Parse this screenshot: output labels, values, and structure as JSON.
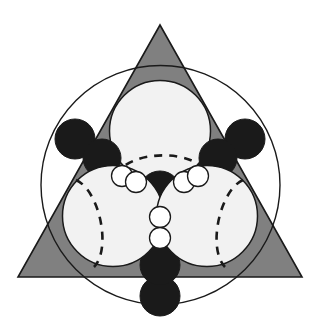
{
  "figure": {
    "canvas": {
      "width": 319,
      "height": 325,
      "background": "#ffffff"
    },
    "palette": {
      "triangle_fill": "#808080",
      "triangle_stroke": "#1a1a1a",
      "large_sphere_fill": "#f2f2f2",
      "large_sphere_stroke": "#1a1a1a",
      "small_sphere_fill": "#ffffff",
      "small_sphere_stroke": "#1a1a1a",
      "black_sphere_fill": "#1a1a1a",
      "black_sphere_stroke": "#1a1a1a",
      "circumcircle_stroke": "#1a1a1a",
      "dashed_stroke": "#1a1a1a"
    },
    "triangle": {
      "label": "outer-triangle",
      "points": "160,25 302,277 18,277",
      "fill": "#808080",
      "stroke": "#1a1a1a",
      "stroke_width": 1.6
    },
    "circumcircle": {
      "label": "circumscribed-circle",
      "cx": 160.5,
      "cy": 185,
      "r": 119.5,
      "stroke": "#1a1a1a",
      "stroke_width": 1.4
    },
    "large_spheres": [
      {
        "name": "top-sphere",
        "cx": 160,
        "cy": 131,
        "r": 50.5
      },
      {
        "name": "left-sphere",
        "cx": 113,
        "cy": 216,
        "r": 50.5
      },
      {
        "name": "right-sphere",
        "cx": 207,
        "cy": 216,
        "r": 50.5
      }
    ],
    "dashed_arcs": [
      {
        "name": "top-sphere-equator",
        "d": "M 116 176 C 128 150 196 150 206 174",
        "rotate": 0
      },
      {
        "name": "left-sphere-equator",
        "d": "M 78 178 C 100 188 110 250 93 268",
        "rotate": 0
      },
      {
        "name": "right-sphere-equator",
        "d": "M 241 178 C 221 190 211 250 229 268",
        "rotate": 0
      }
    ],
    "black_spheres": [
      {
        "name": "black-sphere-upper-left-outer",
        "cx": 75,
        "cy": 139,
        "r": 20
      },
      {
        "name": "black-sphere-upper-left-inner",
        "cx": 102,
        "cy": 158,
        "r": 19
      },
      {
        "name": "black-sphere-upper-right-inner",
        "cx": 218,
        "cy": 158,
        "r": 19
      },
      {
        "name": "black-sphere-upper-right-outer",
        "cx": 245,
        "cy": 139,
        "r": 20
      },
      {
        "name": "black-sphere-center",
        "cx": 160,
        "cy": 192,
        "r": 21
      },
      {
        "name": "black-sphere-bottom-inner",
        "cx": 160,
        "cy": 265,
        "r": 20
      },
      {
        "name": "black-sphere-bottom-outer",
        "cx": 160,
        "cy": 296,
        "r": 20
      }
    ],
    "small_spheres": [
      {
        "name": "small-sphere-left-outer",
        "cx": 122,
        "cy": 176,
        "r": 10.5
      },
      {
        "name": "small-sphere-left-inner",
        "cx": 136,
        "cy": 182,
        "r": 10.5
      },
      {
        "name": "small-sphere-right-inner",
        "cx": 184,
        "cy": 182,
        "r": 10.5
      },
      {
        "name": "small-sphere-right-outer",
        "cx": 198,
        "cy": 176,
        "r": 10.5
      },
      {
        "name": "small-sphere-center-upper",
        "cx": 160,
        "cy": 217,
        "r": 10.5
      },
      {
        "name": "small-sphere-center-lower",
        "cx": 160,
        "cy": 238,
        "r": 10.5
      }
    ],
    "counts": {
      "large_spheres": 3,
      "black_spheres": 7,
      "small_spheres": 6
    }
  }
}
